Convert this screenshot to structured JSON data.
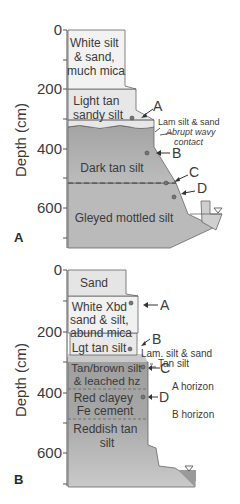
{
  "axis": {
    "label": "Depth (cm)",
    "ticks": [
      "0",
      "200",
      "400",
      "600"
    ]
  },
  "panelA": {
    "id": "A",
    "layers": [
      {
        "name": "white-silt-sand",
        "lines": [
          "White silt",
          "& sand,",
          "much mica"
        ],
        "color": "#f1f1f1"
      },
      {
        "name": "light-tan-sandy-silt",
        "lines": [
          "Light tan",
          "sandy silt"
        ],
        "color": "#e6e6e6"
      },
      {
        "name": "dark-tan-silt",
        "lines": [
          "Dark tan silt"
        ],
        "color": "#a9a9a9"
      },
      {
        "name": "gleyed-mottled-silt",
        "lines": [
          "Gleyed mottled silt"
        ],
        "color": "#b9b9b9"
      }
    ],
    "annotations": {
      "lam": "Lam silt & sand",
      "contact1": "Abrupt wavy",
      "contact2": "contact"
    },
    "samples": [
      "A",
      "B",
      "C",
      "D"
    ]
  },
  "panelB": {
    "id": "B",
    "layers": [
      {
        "name": "sand",
        "lines": [
          "Sand"
        ],
        "color": "#e4e4e4"
      },
      {
        "name": "white-xbd-sand-silt",
        "lines": [
          "White Xbd",
          "sand & silt,",
          "abund mica"
        ],
        "color": "#f0f0f0"
      },
      {
        "name": "lgt-tan-silt",
        "lines": [
          "Lgt tan silt"
        ],
        "color": "#e8e8e8"
      },
      {
        "name": "tan-brown-silt",
        "lines": [
          "Tan/brown silt",
          "& leached hz"
        ],
        "color": "#a8a8a8"
      },
      {
        "name": "red-clayey",
        "lines": [
          "Red clayey",
          "Fe cement"
        ],
        "color": "#a0a0a0"
      },
      {
        "name": "reddish-tan-silt",
        "lines": [
          "Reddish tan",
          "silt"
        ],
        "color": "#c4c4c4"
      }
    ],
    "annotations": {
      "lam": "Lam. silt & sand",
      "tan": "Tan silt",
      "a_horizon": "A horizon",
      "b_horizon": "B horizon"
    },
    "samples": [
      "A",
      "B",
      "C",
      "D"
    ]
  }
}
